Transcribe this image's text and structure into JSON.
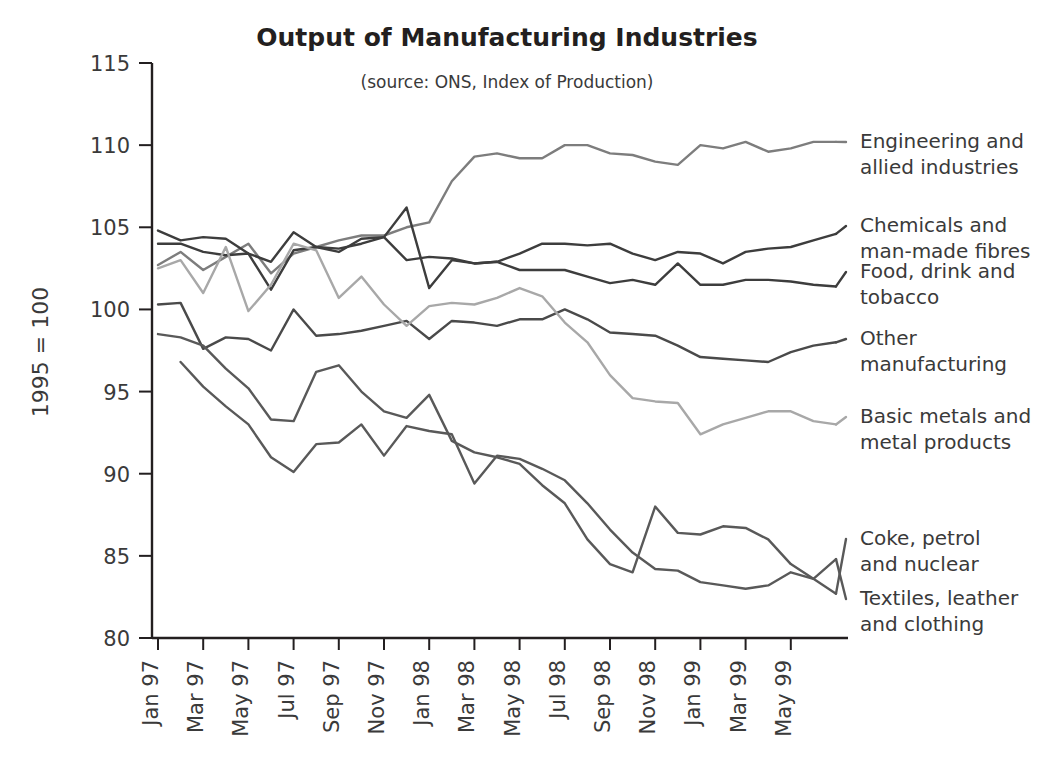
{
  "chart_data": {
    "type": "line",
    "title": "Output of Manufacturing Industries",
    "subtitle": "(source: ONS, Index of Production)",
    "xlabel": "",
    "ylabel": "1995 = 100",
    "ylim": [
      80,
      115
    ],
    "yticks": [
      80,
      85,
      90,
      95,
      100,
      105,
      110,
      115
    ],
    "grid": false,
    "legend_position": "right-inline-labels",
    "x": [
      "Jan 97",
      "Feb 97",
      "Mar 97",
      "Apr 97",
      "May 97",
      "Jun 97",
      "Jul 97",
      "Aug 97",
      "Sep 97",
      "Oct 97",
      "Nov 97",
      "Dec 97",
      "Jan 98",
      "Feb 98",
      "Mar 98",
      "Apr 98",
      "May 98",
      "Jun 98",
      "Jul 98",
      "Aug 98",
      "Sep 98",
      "Oct 98",
      "Nov 98",
      "Dec 98",
      "Jan 99",
      "Feb 99",
      "Mar 99",
      "Apr 99",
      "May 99",
      "Jun 99",
      "Jul 99"
    ],
    "xticks": [
      "Jan 97",
      "Mar 97",
      "May 97",
      "Jul 97",
      "Sep 97",
      "Nov 97",
      "Jan 98",
      "Mar 98",
      "May 98",
      "Jul 98",
      "Sep 98",
      "Nov 98",
      "Jan 99",
      "Mar 99",
      "May 99"
    ],
    "series": [
      {
        "name": "Engineering and allied industries",
        "color": "#7d7d7d",
        "values": [
          102.7,
          103.5,
          102.4,
          103.2,
          104.0,
          102.2,
          103.4,
          103.8,
          104.2,
          104.5,
          104.5,
          105.0,
          105.3,
          107.8,
          109.3,
          109.5,
          109.2,
          109.2,
          110.0,
          110.0,
          109.5,
          109.4,
          109.0,
          108.8,
          110.0,
          109.8,
          110.2,
          109.6,
          109.8,
          110.2,
          110.2
        ]
      },
      {
        "name": "Chemicals and man-made fibres",
        "color": "#3d3d3d",
        "values": [
          104.8,
          104.2,
          104.4,
          104.3,
          103.4,
          102.9,
          104.7,
          103.8,
          103.7,
          104.0,
          104.4,
          103.0,
          103.2,
          103.1,
          102.8,
          102.9,
          103.4,
          104.0,
          104.0,
          103.9,
          104.0,
          103.4,
          103.0,
          103.5,
          103.4,
          102.8,
          103.5,
          103.7,
          103.8,
          104.2,
          104.6
        ]
      },
      {
        "name": "Food, drink and tobacco",
        "color": "#3d3d3d",
        "values": [
          104.0,
          104.0,
          103.5,
          103.3,
          103.4,
          101.2,
          103.6,
          103.8,
          103.5,
          104.3,
          104.4,
          106.2,
          101.3,
          103.0,
          102.8,
          102.9,
          102.4,
          102.4,
          102.4,
          102.0,
          101.6,
          101.8,
          101.5,
          102.8,
          101.5,
          101.5,
          101.8,
          101.8,
          101.7,
          101.5,
          101.4
        ]
      },
      {
        "name": "Other manufacturing",
        "color": "#4a4a4a",
        "values": [
          100.3,
          100.4,
          97.6,
          98.3,
          98.2,
          97.5,
          100.0,
          98.4,
          98.5,
          98.7,
          99.0,
          99.3,
          98.2,
          99.3,
          99.2,
          99.0,
          99.4,
          99.4,
          100.0,
          99.4,
          98.6,
          98.5,
          98.4,
          97.8,
          97.1,
          97.0,
          96.9,
          96.8,
          97.4,
          97.8,
          98.0
        ]
      },
      {
        "name": "Basic metals and metal products",
        "color": "#a8a8a8",
        "values": [
          102.5,
          103.0,
          101.0,
          103.8,
          99.9,
          101.5,
          104.0,
          103.6,
          100.7,
          102.0,
          100.3,
          99.0,
          100.2,
          100.4,
          100.3,
          100.7,
          101.3,
          100.8,
          99.2,
          98.0,
          96.0,
          94.6,
          94.4,
          94.3,
          92.4,
          93.0,
          93.4,
          93.8,
          93.8,
          93.2,
          93.0
        ]
      },
      {
        "name": "Coke, petrol and nuclear",
        "color": "#595959",
        "values": [
          98.5,
          98.3,
          97.8,
          96.4,
          95.2,
          93.3,
          93.2,
          96.2,
          96.6,
          95.0,
          93.8,
          93.4,
          94.8,
          92.0,
          91.3,
          91.0,
          90.6,
          89.3,
          88.2,
          86.0,
          84.5,
          84.0,
          88.0,
          86.4,
          86.3,
          86.8,
          86.7,
          86.0,
          84.5,
          83.6,
          82.7
        ]
      },
      {
        "name": "Textiles, leather and clothing",
        "color": "#595959",
        "values": [
          null,
          96.8,
          95.3,
          94.1,
          93.0,
          91.0,
          90.1,
          91.8,
          91.9,
          93.0,
          91.1,
          92.9,
          92.6,
          92.4,
          89.4,
          91.1,
          90.9,
          90.3,
          89.6,
          88.2,
          86.6,
          85.2,
          84.2,
          84.1,
          83.4,
          83.2,
          83.0,
          83.2,
          84.0,
          83.6,
          84.8
        ]
      }
    ],
    "series_labels": [
      {
        "name": "Engineering and allied industries",
        "lines": [
          "Engineering and",
          "allied industries"
        ]
      },
      {
        "name": "Chemicals and man-made fibres",
        "lines": [
          "Chemicals and",
          "man-made fibres"
        ]
      },
      {
        "name": "Food, drink and tobacco",
        "lines": [
          "Food, drink and",
          "tobacco"
        ]
      },
      {
        "name": "Other manufacturing",
        "lines": [
          "Other",
          "manufacturing"
        ]
      },
      {
        "name": "Basic metals and metal products",
        "lines": [
          "Basic metals and",
          "metal products"
        ]
      },
      {
        "name": "Coke, petrol and nuclear",
        "lines": [
          "Coke, petrol",
          "and nuclear"
        ]
      },
      {
        "name": "Textiles, leather and clothing",
        "lines": [
          "Textiles, leather",
          "and clothing"
        ]
      }
    ]
  }
}
